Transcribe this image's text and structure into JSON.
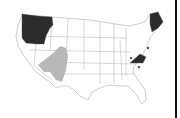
{
  "map": {
    "type": "us-states-choropleth",
    "colors": {
      "default": "#ffffff",
      "border": "#9a9a9a",
      "dark": "#2b2b2b",
      "gray": "#b8b8b8",
      "frame": "#111111"
    },
    "highlighted_dark": [
      "Washington",
      "Oregon",
      "Idaho",
      "Maine",
      "Virginia"
    ],
    "highlighted_gray_region": "Southwest (Nevada / Utah / Arizona / New Mexico area)"
  }
}
